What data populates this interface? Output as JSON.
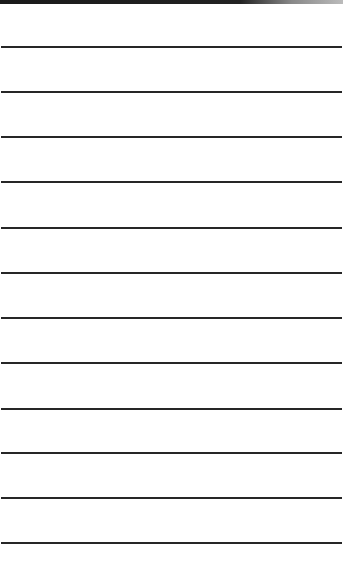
{
  "page": {
    "type": "lined-paper",
    "background_color": "#ffffff",
    "line_color": "#262626",
    "top_band_color": "#1a1a1a",
    "line_count": 12,
    "line_positions_y": [
      47,
      92,
      137,
      182,
      228,
      273,
      318,
      363,
      409,
      453,
      498,
      543
    ]
  }
}
